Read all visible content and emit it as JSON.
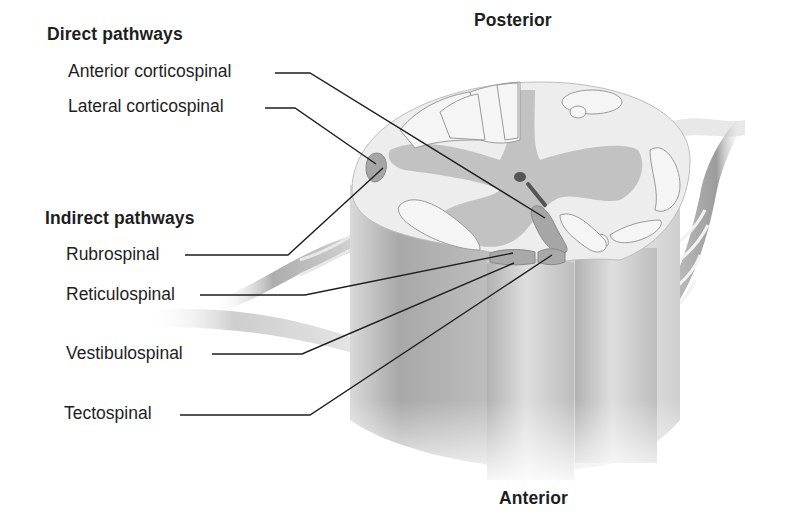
{
  "diagram": {
    "orientation": {
      "top": "Posterior",
      "bottom": "Anterior"
    },
    "groups": [
      {
        "heading": "Direct pathways",
        "tracts": [
          "Anterior corticospinal",
          "Lateral corticospinal"
        ]
      },
      {
        "heading": "Indirect pathways",
        "tracts": [
          "Rubrospinal",
          "Reticulospinal",
          "Vestibulospinal",
          "Tectospinal"
        ]
      }
    ],
    "colors": {
      "background": "#ffffff",
      "white_matter": "#ededed",
      "gray_matter": "#b9b9b9",
      "tract_highlight": "#9a9a9a",
      "leader_line": "#1e1e1e",
      "text": "#1e1e1e"
    }
  }
}
